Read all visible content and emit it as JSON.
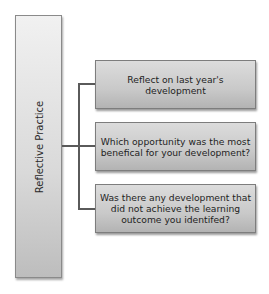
{
  "diagram": {
    "type": "hierarchy",
    "root": {
      "label": "Reflective Practice"
    },
    "children": [
      {
        "label": "Reflect on last year's development"
      },
      {
        "label": "Which opportunity was the most benefical for your development?"
      },
      {
        "label": "Was there any development that did not achieve the learning outcome you identifed?"
      }
    ],
    "colors": {
      "box_light": "#f1f1f1",
      "box_dark": "#bdbdbd",
      "border": "#7d7d7d",
      "connector": "#5a5a5a"
    }
  }
}
